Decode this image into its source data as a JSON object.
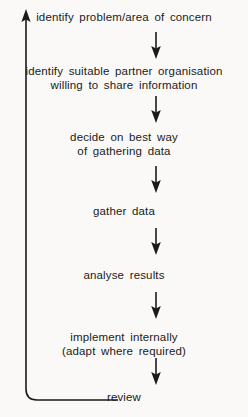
{
  "diagram": {
    "background_color": "#faf9f7",
    "ink_color": "#1b1b1b",
    "nodes": [
      {
        "id": "n1",
        "lines": [
          "identify problem/area of concern"
        ]
      },
      {
        "id": "n2",
        "lines": [
          "identify suitable partner organisation",
          "willing to share information"
        ]
      },
      {
        "id": "n3",
        "lines": [
          "decide on best way",
          "of gathering data"
        ]
      },
      {
        "id": "n4",
        "lines": [
          "gather data"
        ]
      },
      {
        "id": "n5",
        "lines": [
          "analyse results"
        ]
      },
      {
        "id": "n6",
        "lines": [
          "implement internally",
          "(adapt where required)"
        ]
      },
      {
        "id": "n7",
        "lines": [
          "review"
        ]
      }
    ],
    "connectors": [
      {
        "id": "a1",
        "from": "n1",
        "to": "n2",
        "direction": "down"
      },
      {
        "id": "a2",
        "from": "n2",
        "to": "n3",
        "direction": "down"
      },
      {
        "id": "a3",
        "from": "n3",
        "to": "n4",
        "direction": "down"
      },
      {
        "id": "a4",
        "from": "n4",
        "to": "n5",
        "direction": "down"
      },
      {
        "id": "a5",
        "from": "n5",
        "to": "n6",
        "direction": "down"
      },
      {
        "id": "a6",
        "from": "n6",
        "to": "n7",
        "direction": "down"
      }
    ],
    "feedback_loop": {
      "from": "review",
      "to": "identify problem/area of concern",
      "direction": "up",
      "label": ""
    }
  }
}
